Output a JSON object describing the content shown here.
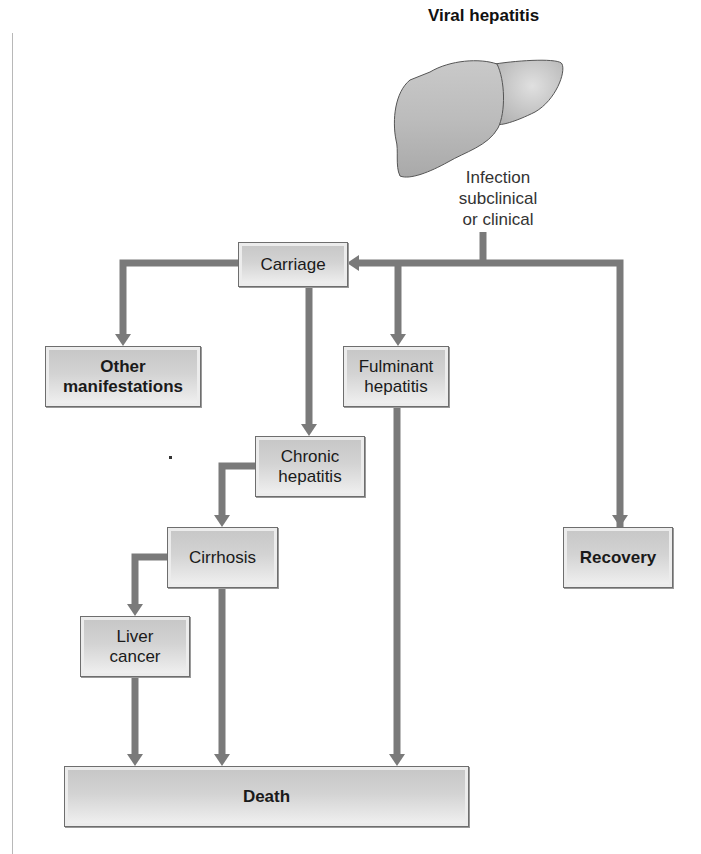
{
  "diagram": {
    "title": "Viral hepatitis",
    "infection_label_lines": [
      "Infection",
      "subclinical",
      "or clinical"
    ],
    "nodes": {
      "carriage": "Carriage",
      "other_manifestations": "Other manifestations",
      "fulminant_hepatitis": "Fulminant hepatitis",
      "chronic_hepatitis": "Chronic hepatitis",
      "cirrhosis": "Cirrhosis",
      "liver_cancer": "Liver cancer",
      "recovery": "Recovery",
      "death": "Death"
    },
    "edges": [
      [
        "infection",
        "carriage"
      ],
      [
        "infection",
        "fulminant_hepatitis"
      ],
      [
        "infection",
        "recovery"
      ],
      [
        "carriage",
        "other_manifestations"
      ],
      [
        "carriage",
        "chronic_hepatitis"
      ],
      [
        "chronic_hepatitis",
        "cirrhosis"
      ],
      [
        "cirrhosis",
        "liver_cancer"
      ],
      [
        "cirrhosis",
        "death"
      ],
      [
        "liver_cancer",
        "death"
      ],
      [
        "fulminant_hepatitis",
        "death"
      ]
    ],
    "colors": {
      "arrow": "#7a7a7a",
      "box_border": "#6e6e6e",
      "box_fill_top": "#c6c6c6",
      "box_fill_bottom": "#f2f2f2",
      "liver_fill": "#bdbdbd",
      "liver_outline": "#555555"
    }
  }
}
